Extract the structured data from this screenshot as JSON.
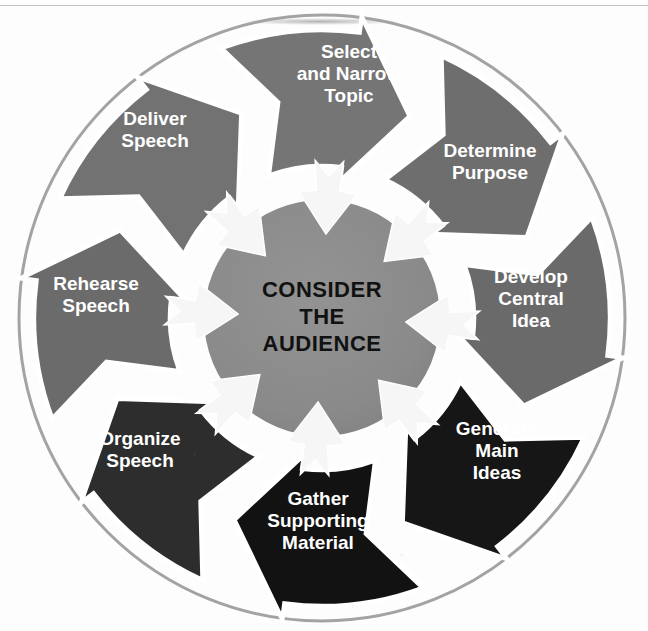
{
  "figure": {
    "kind": "circular-process-cycle",
    "center_text": [
      "CONSIDER",
      "THE",
      "AUDIENCE"
    ],
    "center_text_color": "#111111",
    "canvas": {
      "width": 648,
      "height": 631
    },
    "geometry": {
      "cx": 322,
      "cy": 318,
      "outline_radius": 303,
      "wedge_outer_radius": 288,
      "wedge_inner_radius": 152,
      "hub_radius": 118,
      "step_count": 8
    },
    "palette": {
      "separator": "#ffffff",
      "page": "#fdfdfd",
      "hub": "#8a8a8a",
      "outline_ring": "#a0a0a0",
      "inner_arrow": "#f6f6f6",
      "label_light": "#ffffff"
    },
    "steps": [
      {
        "id": "select-and-narrow-topic",
        "label": [
          "Select",
          "and Narrow",
          "Topic"
        ],
        "fill": "#757575",
        "label_fill": "#ffffff"
      },
      {
        "id": "determine-purpose",
        "label": [
          "Determine",
          "Purpose"
        ],
        "fill": "#6e6e6e",
        "label_fill": "#ffffff"
      },
      {
        "id": "develop-central-idea",
        "label": [
          "Develop",
          "Central",
          "Idea"
        ],
        "fill": "#6a6a6a",
        "label_fill": "#ffffff"
      },
      {
        "id": "generate-main-ideas",
        "label": [
          "Generate",
          "Main",
          "Ideas"
        ],
        "fill": "#161616",
        "label_fill": "#e8e8e8"
      },
      {
        "id": "gather-supporting-material",
        "label": [
          "Gather",
          "Supporting",
          "Material"
        ],
        "fill": "#121212",
        "label_fill": "#e8e8e8"
      },
      {
        "id": "organize-speech",
        "label": [
          "Organize",
          "Speech"
        ],
        "fill": "#2d2d2d",
        "label_fill": "#d9d9d9"
      },
      {
        "id": "rehearse-speech",
        "label": [
          "Rehearse",
          "Speech"
        ],
        "fill": "#6b6b6b",
        "label_fill": "#ffffff"
      },
      {
        "id": "deliver-speech",
        "label": [
          "Deliver",
          "Speech"
        ],
        "fill": "#727272",
        "label_fill": "#ffffff"
      }
    ],
    "label_positions": [
      {
        "x": 349,
        "y": 75,
        "lines": 3
      },
      {
        "x": 490,
        "y": 163,
        "lines": 2
      },
      {
        "x": 531,
        "y": 300,
        "lines": 3
      },
      {
        "x": 497,
        "y": 452,
        "lines": 3
      },
      {
        "x": 318,
        "y": 522,
        "lines": 3
      },
      {
        "x": 140,
        "y": 451,
        "lines": 2
      },
      {
        "x": 96,
        "y": 296,
        "lines": 2
      },
      {
        "x": 155,
        "y": 131,
        "lines": 2
      }
    ]
  }
}
